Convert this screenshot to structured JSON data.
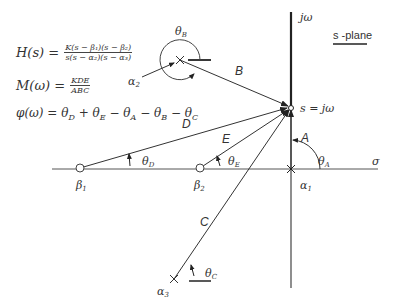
{
  "equations": {
    "H": {
      "lhs": "H(s) =",
      "num": "K(s − β₁)(s − β₂)",
      "den": "s(s − α₂)(s − α₃)"
    },
    "M": {
      "lhs": "M(ω) =",
      "num": "KDE",
      "den": "ABC"
    },
    "phi": {
      "text": "φ(ω) = θD + θE − θA − θB − θC"
    }
  },
  "plane_label": "s -plane",
  "axes": {
    "imag": "jω",
    "real": "σ"
  },
  "point_label": "s = jω",
  "vectors": {
    "A": "A",
    "B": "B",
    "C": "C",
    "D": "D",
    "E": "E"
  },
  "angles": {
    "A": "θ",
    "A_sub": "A",
    "B": "θ",
    "B_sub": "B",
    "C": "θ",
    "C_sub": "C",
    "D": "θ",
    "D_sub": "D",
    "E": "θ",
    "E_sub": "E"
  },
  "poles": {
    "a1": "α",
    "a1_sub": "1",
    "a2": "α",
    "a2_sub": "2",
    "a3": "α",
    "a3_sub": "3"
  },
  "zeros": {
    "b1": "β",
    "b1_sub": "1",
    "b2": "β",
    "b2_sub": "2"
  },
  "geometry": {
    "origin_point": [
      291,
      108
    ],
    "alpha1": [
      291,
      169
    ],
    "alpha2": [
      180,
      60
    ],
    "alpha3": [
      174,
      279
    ],
    "beta1": [
      80,
      168
    ],
    "beta2": [
      200,
      168
    ]
  }
}
